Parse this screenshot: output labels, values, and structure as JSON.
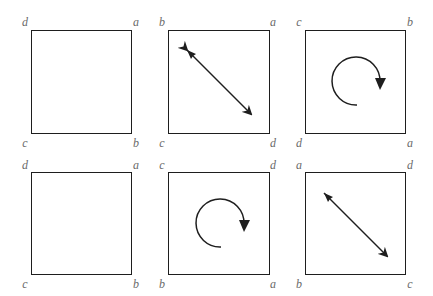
{
  "figure": {
    "stroke_color": "#1e1e1e",
    "label_color": "#6a6a6a"
  },
  "panels": [
    {
      "id": "top-left",
      "box": {
        "x": 31,
        "y": 30,
        "w": 101,
        "h": 104
      },
      "labels": {
        "top_left": "d",
        "top_right": "a",
        "bottom_left": "c",
        "bottom_right": "b"
      },
      "symbol": "none"
    },
    {
      "id": "top-middle",
      "box": {
        "x": 168,
        "y": 30,
        "w": 102,
        "h": 104
      },
      "labels": {
        "top_left": "b",
        "top_right": "a",
        "bottom_left": "c",
        "bottom_right": "d"
      },
      "symbol": "diagonal-double-arrow",
      "arrow": {
        "x1": 187,
        "y1": 50,
        "x2": 251,
        "y2": 114
      }
    },
    {
      "id": "top-right",
      "box": {
        "x": 305,
        "y": 30,
        "w": 101,
        "h": 104
      },
      "labels": {
        "top_left": "c",
        "top_right": "b",
        "bottom_left": "d",
        "bottom_right": "a"
      },
      "symbol": "rotation-arrow",
      "rotation": {
        "cx": 357,
        "cy": 81,
        "r": 24
      }
    },
    {
      "id": "bottom-left",
      "box": {
        "x": 31,
        "y": 172,
        "w": 101,
        "h": 103
      },
      "labels": {
        "top_left": "d",
        "top_right": "a",
        "bottom_left": "c",
        "bottom_right": "b"
      },
      "symbol": "none"
    },
    {
      "id": "bottom-middle",
      "box": {
        "x": 168,
        "y": 172,
        "w": 102,
        "h": 103
      },
      "labels": {
        "top_left": "c",
        "top_right": "d",
        "bottom_left": "b",
        "bottom_right": "a"
      },
      "symbol": "rotation-arrow",
      "rotation": {
        "cx": 221,
        "cy": 223,
        "r": 24
      }
    },
    {
      "id": "bottom-right",
      "box": {
        "x": 305,
        "y": 172,
        "w": 101,
        "h": 103
      },
      "labels": {
        "top_left": "a",
        "top_right": "d",
        "bottom_left": "b",
        "bottom_right": "c"
      },
      "symbol": "diagonal-double-arrow",
      "arrow": {
        "x1": 324,
        "y1": 193,
        "x2": 387,
        "y2": 256
      }
    }
  ]
}
